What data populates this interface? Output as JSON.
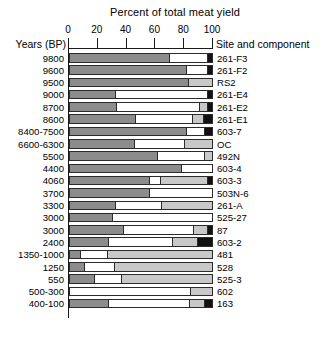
{
  "chart_data": {
    "type": "bar",
    "orientation": "horizontal",
    "stacked": true,
    "title": "Percent of total meat yield",
    "xlabel": "Percent of total meat yield",
    "ylabel": "Years (BP)",
    "row_header_left": "Years (BP)",
    "row_header_right": "Site and component",
    "xlim": [
      0,
      100
    ],
    "xticks": [
      0,
      20,
      40,
      60,
      80,
      100
    ],
    "xtick_labels": [
      "0",
      "20",
      "40",
      "60",
      "80",
      "100"
    ],
    "grid": false,
    "legend": null,
    "colors": {
      "dark_gray": "#8c8c8c",
      "white": "#ffffff",
      "light_gray": "#c8c8c8",
      "black": "#111111",
      "outline": "#2b2b2b"
    },
    "series": [
      {
        "name": "dark-gray",
        "color": "#8c8c8c"
      },
      {
        "name": "white",
        "color": "#ffffff"
      },
      {
        "name": "light-gray",
        "color": "#c8c8c8"
      },
      {
        "name": "black",
        "color": "#111111"
      }
    ],
    "categories": [
      "9800",
      "9600",
      "9500",
      "9000",
      "8700",
      "8600",
      "8400-7500",
      "6600-6300",
      "5500",
      "4400",
      "4060",
      "3700",
      "3300",
      "3000",
      "3000",
      "2400",
      "1350-1000",
      "1250",
      "550",
      "500-300",
      "400-100"
    ],
    "site_labels": [
      "261-F3",
      "261-F2",
      "RS2",
      "261-E4",
      "261-E2",
      "261-E1",
      "603-7",
      "OC",
      "492N",
      "603-4",
      "603-3",
      "503N-6",
      "261-A",
      "525-27",
      "87",
      "603-2",
      "481",
      "528",
      "525-3",
      "602",
      "163"
    ],
    "rows": [
      {
        "year": "9800",
        "site": "261-F3",
        "segments": [
          {
            "color": "#8c8c8c",
            "value": 71
          },
          {
            "color": "#ffffff",
            "value": 26
          },
          {
            "color": "#111111",
            "value": 3
          }
        ]
      },
      {
        "year": "9600",
        "site": "261-F2",
        "segments": [
          {
            "color": "#8c8c8c",
            "value": 83
          },
          {
            "color": "#ffffff",
            "value": 14
          },
          {
            "color": "#111111",
            "value": 3
          }
        ]
      },
      {
        "year": "9500",
        "site": "RS2",
        "segments": [
          {
            "color": "#8c8c8c",
            "value": 84
          },
          {
            "color": "#c8c8c8",
            "value": 16
          }
        ]
      },
      {
        "year": "9000",
        "site": "261-E4",
        "segments": [
          {
            "color": "#8c8c8c",
            "value": 32
          },
          {
            "color": "#ffffff",
            "value": 65
          },
          {
            "color": "#111111",
            "value": 3
          }
        ]
      },
      {
        "year": "8700",
        "site": "261-E2",
        "segments": [
          {
            "color": "#8c8c8c",
            "value": 33
          },
          {
            "color": "#ffffff",
            "value": 59
          },
          {
            "color": "#c8c8c8",
            "value": 5
          },
          {
            "color": "#111111",
            "value": 3
          }
        ]
      },
      {
        "year": "8600",
        "site": "261-E1",
        "segments": [
          {
            "color": "#8c8c8c",
            "value": 47
          },
          {
            "color": "#ffffff",
            "value": 40
          },
          {
            "color": "#c8c8c8",
            "value": 7
          },
          {
            "color": "#111111",
            "value": 6
          }
        ]
      },
      {
        "year": "8400-7500",
        "site": "603-7",
        "segments": [
          {
            "color": "#8c8c8c",
            "value": 83
          },
          {
            "color": "#ffffff",
            "value": 12
          },
          {
            "color": "#111111",
            "value": 5
          }
        ]
      },
      {
        "year": "6600-6300",
        "site": "OC",
        "segments": [
          {
            "color": "#8c8c8c",
            "value": 46
          },
          {
            "color": "#ffffff",
            "value": 35
          },
          {
            "color": "#c8c8c8",
            "value": 19
          }
        ]
      },
      {
        "year": "5500",
        "site": "492N",
        "segments": [
          {
            "color": "#8c8c8c",
            "value": 62
          },
          {
            "color": "#ffffff",
            "value": 33
          },
          {
            "color": "#c8c8c8",
            "value": 5
          }
        ]
      },
      {
        "year": "4400",
        "site": "603-4",
        "segments": [
          {
            "color": "#8c8c8c",
            "value": 79
          },
          {
            "color": "#ffffff",
            "value": 21
          }
        ]
      },
      {
        "year": "4060",
        "site": "603-3",
        "segments": [
          {
            "color": "#8c8c8c",
            "value": 57
          },
          {
            "color": "#ffffff",
            "value": 7
          },
          {
            "color": "#c8c8c8",
            "value": 33
          },
          {
            "color": "#111111",
            "value": 3
          }
        ]
      },
      {
        "year": "3700",
        "site": "503N-6",
        "segments": [
          {
            "color": "#8c8c8c",
            "value": 56
          },
          {
            "color": "#ffffff",
            "value": 44
          }
        ]
      },
      {
        "year": "3300",
        "site": "261-A",
        "segments": [
          {
            "color": "#8c8c8c",
            "value": 32
          },
          {
            "color": "#ffffff",
            "value": 32
          },
          {
            "color": "#c8c8c8",
            "value": 36
          }
        ]
      },
      {
        "year": "3000",
        "site": "525-27",
        "segments": [
          {
            "color": "#8c8c8c",
            "value": 30
          },
          {
            "color": "#ffffff",
            "value": 70
          }
        ]
      },
      {
        "year": "3000",
        "site": "87",
        "segments": [
          {
            "color": "#8c8c8c",
            "value": 38
          },
          {
            "color": "#ffffff",
            "value": 50
          },
          {
            "color": "#c8c8c8",
            "value": 9
          },
          {
            "color": "#111111",
            "value": 3
          }
        ]
      },
      {
        "year": "2400",
        "site": "603-2",
        "segments": [
          {
            "color": "#8c8c8c",
            "value": 27
          },
          {
            "color": "#ffffff",
            "value": 46
          },
          {
            "color": "#c8c8c8",
            "value": 17
          },
          {
            "color": "#111111",
            "value": 10
          }
        ]
      },
      {
        "year": "1350-1000",
        "site": "481",
        "segments": [
          {
            "color": "#8c8c8c",
            "value": 7
          },
          {
            "color": "#ffffff",
            "value": 19
          },
          {
            "color": "#c8c8c8",
            "value": 74
          }
        ]
      },
      {
        "year": "1250",
        "site": "528",
        "segments": [
          {
            "color": "#8c8c8c",
            "value": 10
          },
          {
            "color": "#ffffff",
            "value": 21
          },
          {
            "color": "#c8c8c8",
            "value": 69
          }
        ]
      },
      {
        "year": "550",
        "site": "525-3",
        "segments": [
          {
            "color": "#8c8c8c",
            "value": 17
          },
          {
            "color": "#ffffff",
            "value": 19
          },
          {
            "color": "#c8c8c8",
            "value": 64
          }
        ]
      },
      {
        "year": "500-300",
        "site": "602",
        "segments": [
          {
            "color": "#ffffff",
            "value": 85
          },
          {
            "color": "#c8c8c8",
            "value": 15
          }
        ]
      },
      {
        "year": "400-100",
        "site": "163",
        "segments": [
          {
            "color": "#8c8c8c",
            "value": 27
          },
          {
            "color": "#ffffff",
            "value": 58
          },
          {
            "color": "#c8c8c8",
            "value": 10
          },
          {
            "color": "#111111",
            "value": 5
          }
        ]
      }
    ]
  }
}
